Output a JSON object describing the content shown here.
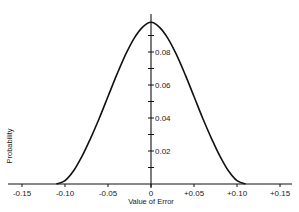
{
  "chart_data": {
    "type": "line",
    "title": "",
    "xlabel": "Value of Error",
    "ylabel": "Probability",
    "xlim": [
      -0.16,
      0.165
    ],
    "ylim": [
      0,
      0.1
    ],
    "grid": false,
    "legend": null,
    "x_ticks": [
      -0.15,
      -0.1,
      -0.05,
      0,
      0.05,
      0.1,
      0.15
    ],
    "x_tick_labels": [
      "-0.15",
      "-0.10",
      "-0.05",
      "0",
      "+0.05",
      "+0.10",
      "+0.15"
    ],
    "y_ticks": [
      0.01,
      0.02,
      0.03,
      0.04,
      0.05,
      0.06,
      0.07,
      0.08,
      0.09
    ],
    "y_tick_labels": [
      "0.02",
      "0.04",
      "0.06",
      "0.08"
    ],
    "y_labeled_ticks": [
      0.02,
      0.04,
      0.06,
      0.08
    ],
    "series": [
      {
        "name": "Probability curve",
        "x": [
          -0.11,
          -0.1,
          -0.09,
          -0.08,
          -0.07,
          -0.06,
          -0.05,
          -0.04,
          -0.03,
          -0.02,
          -0.01,
          0,
          0.01,
          0.02,
          0.03,
          0.04,
          0.05,
          0.06,
          0.07,
          0.08,
          0.09,
          0.1,
          0.11
        ],
        "y": [
          0.0,
          0.002,
          0.008,
          0.017,
          0.028,
          0.04,
          0.053,
          0.066,
          0.078,
          0.088,
          0.095,
          0.098,
          0.095,
          0.088,
          0.078,
          0.066,
          0.053,
          0.04,
          0.028,
          0.017,
          0.008,
          0.002,
          0.0
        ]
      }
    ]
  },
  "labels": {
    "xlabel": "Value of Error",
    "ylabel": "Probability"
  }
}
